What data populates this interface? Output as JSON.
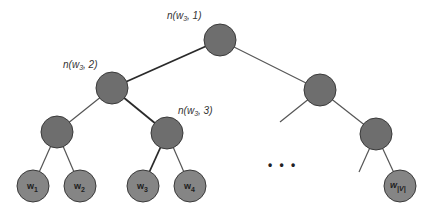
{
  "diagram": {
    "type": "binary-tree",
    "colors": {
      "inner_node": "#6e6e6e",
      "leaf_node": "#858585",
      "edge": "#555555",
      "path_edge": "#2a2a2a"
    },
    "path_labels": {
      "root": {
        "prefix": "n(",
        "var": "w",
        "sub": "3",
        "suffix": ", 1)"
      },
      "level2": {
        "prefix": "n(",
        "var": "w",
        "sub": "3",
        "suffix": ", 2)"
      },
      "level3": {
        "prefix": "n(",
        "var": "w",
        "sub": "3",
        "suffix": ", 3)"
      }
    },
    "leaves": [
      {
        "var": "w",
        "sub": "1"
      },
      {
        "var": "w",
        "sub": "2"
      },
      {
        "var": "w",
        "sub": "3"
      },
      {
        "var": "w",
        "sub": "4"
      },
      {
        "var": "w",
        "sub": "|V|"
      }
    ],
    "ellipsis": "• • •"
  }
}
